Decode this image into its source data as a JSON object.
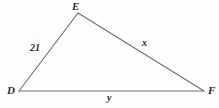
{
  "figure": {
    "type": "geometry-diagram",
    "shape": "triangle",
    "background_color": "#fefefe",
    "stroke_color": "#6e6e6e",
    "text_color": "#2a2a2a",
    "vertices": [
      {
        "name": "E",
        "label": "E",
        "x": 78,
        "y": 13
      },
      {
        "name": "D",
        "label": "D",
        "x": 19,
        "y": 91
      },
      {
        "name": "F",
        "label": "F",
        "x": 204,
        "y": 91
      }
    ],
    "sides": [
      {
        "name": "DE",
        "label": "21",
        "from": "D",
        "to": "E"
      },
      {
        "name": "EF",
        "label": "x",
        "from": "E",
        "to": "F"
      },
      {
        "name": "DF",
        "label": "y",
        "from": "D",
        "to": "F"
      }
    ],
    "labels": {
      "vertex_E": "E",
      "vertex_D": "D",
      "vertex_F": "F",
      "side_DE": "21",
      "side_EF": "x",
      "side_DF": "y"
    }
  }
}
